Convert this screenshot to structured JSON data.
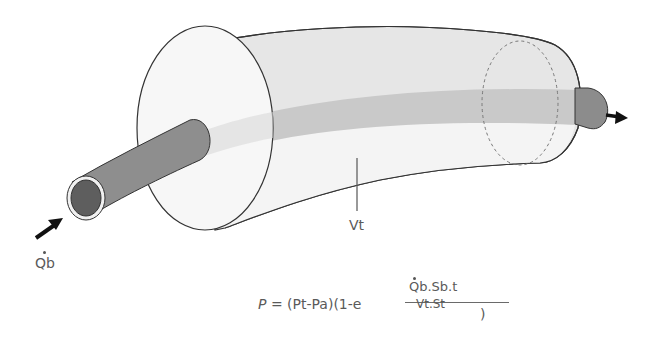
{
  "diagram": {
    "labels": {
      "inflow": "Qb",
      "volume": "Vt"
    },
    "formula": {
      "lhs": "P",
      "equals": "=",
      "rhs_prefix": "(Pt-Pa)(1-e",
      "exponent_numerator": "Qb.Sb.t",
      "exponent_denominator": "Vt.St",
      "close": ")"
    },
    "colors": {
      "tank_fill": "#e4e4e4",
      "tank_end_face": "#f6f6f6",
      "band": "#c8c8c8",
      "pipe": "#8c8c8c",
      "pipe_inner": "#5e5e5e",
      "outline": "#333333",
      "text": "#5a5a5a"
    }
  }
}
